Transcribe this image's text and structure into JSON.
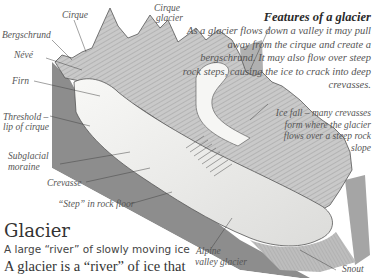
{
  "diagram": {
    "title": "Glacier",
    "subtitle": "A large “river” of slowly moving ice",
    "body_start": "A glacier is a “river” of ice that",
    "features": {
      "heading": "Features of a glacier",
      "text": "As a glacier flows down a valley it may pull away from the cirque and create a bergschrund. It may also flow over steep rock steps, causing the ice to crack into deep crevasses."
    },
    "labels": {
      "cirque": "Cirque",
      "cirque_glacier_1": "Cirque",
      "cirque_glacier_2": "glacier",
      "bergschrund": "Bergschrund",
      "neve": "Névé",
      "firn": "Firn",
      "threshold_1": "Threshold –",
      "threshold_2": "lip of cirque",
      "subglacial_1": "Subglacial",
      "subglacial_2": "moraine",
      "crevasse": "Crevasse",
      "step": "“Step” in rock floor",
      "icefall": "Ice fall – many crevasses form where the glacier flows over a steep rock slope",
      "alpine_1": "Alpine",
      "alpine_2": "valley glacier",
      "snout": "Snout"
    },
    "colors": {
      "rock_face": "#8c8c8c",
      "rock_face_dark": "#6f6f6f",
      "ice": "#f4f4f2",
      "mountain": "#cfcfcf",
      "label_text": "#555555"
    }
  }
}
